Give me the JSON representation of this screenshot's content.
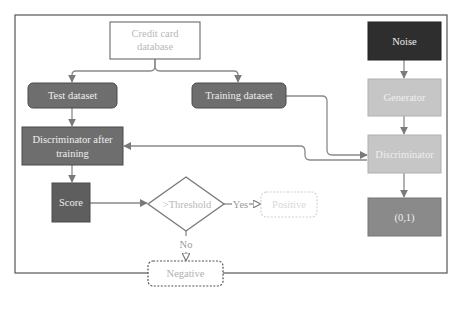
{
  "diagram": {
    "colors": {
      "frame": "#555555",
      "edge": "#8a8a8a",
      "dark_node": "#2e2e2e",
      "mid_node": "#6e6e6e",
      "light_node": "#c6c6c6",
      "dashed_node_border": "#666666",
      "light_text": "#c0c0c0",
      "white_text": "#f2f2f2"
    },
    "nodes": {
      "database": {
        "label_line1": "Credit card",
        "label_line2": "database"
      },
      "test_dataset": {
        "label": "Test dataset"
      },
      "training_dataset": {
        "label": "Training dataset"
      },
      "disc_after_training": {
        "label_line1": "Discriminator after",
        "label_line2": "training"
      },
      "score": {
        "label": "Score"
      },
      "threshold": {
        "label": ">Threshold"
      },
      "positive": {
        "label": "Positive"
      },
      "negative": {
        "label": "Negative"
      },
      "noise": {
        "label": "Noise"
      },
      "generator": {
        "label": "Generator"
      },
      "discriminator": {
        "label": "Discriminator"
      },
      "output": {
        "label": "(0,1)"
      }
    },
    "edge_labels": {
      "yes": "Yes",
      "no": "No"
    }
  }
}
